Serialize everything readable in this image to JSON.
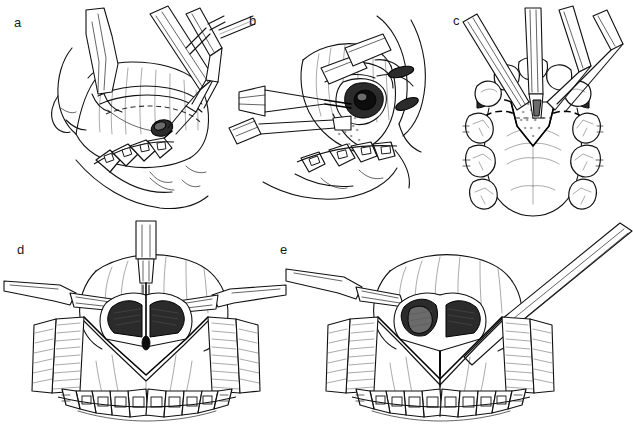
{
  "figure": {
    "kind": "surgical-technique-line-illustration",
    "background_color": "#ffffff",
    "ink_color": "#111111",
    "width": 633,
    "height": 427,
    "panel_count": 5,
    "panels": [
      {
        "label": "a",
        "label_x": 14,
        "label_y": 22,
        "view": "lateral intraoral view",
        "description": "Retractor elevating upper lip with cutting instrument and suction making mucosal incision above dentition",
        "elements": [
          "upper-lip-retractor",
          "surgical-handpiece",
          "suction-tip",
          "forceps",
          "mucosal-incision",
          "maxillary-teeth-with-archwire",
          "lower-lip-outline"
        ]
      },
      {
        "label": "b",
        "label_x": 249,
        "label_y": 20,
        "view": "lateral intraoral view",
        "description": "Subperiosteal dissection with osteotome and retractor exposing anterior maxillary bone and nasal aperture",
        "elements": [
          "osteotome",
          "chisel",
          "retractor-blade",
          "exposed-bone",
          "nasal-aperture-shadow",
          "maxillary-teeth-with-brackets"
        ]
      },
      {
        "label": "c",
        "label_x": 453,
        "label_y": 20,
        "view": "occlusal / palatal view",
        "description": "Palate seen from below with dashed osteotomy cut lines across the anterior palate and instruments entering the anterior segment",
        "elements": [
          "palatal-vault",
          "dashed-osteotomy-line",
          "anterior-palatal-segment",
          "instrument-tips",
          "maxillary-arch-teeth",
          "palatal-rugae"
        ]
      },
      {
        "label": "d",
        "label_x": 17,
        "label_y": 246,
        "view": "anterior frontal view",
        "description": "Degloved anterior maxilla with bilateral mucoperiosteal flaps retracted, bur cutting the midline, nasal septum and piriform rims exposed",
        "elements": [
          "handpiece-bur",
          "left-retractor",
          "right-retractor",
          "mucoperiosteal-flap-left",
          "mucoperiosteal-flap-right",
          "nasal-aperture",
          "nasal-septum",
          "midline-osteotomy",
          "maxillary-teeth-with-brackets",
          "archwire"
        ]
      },
      {
        "label": "e",
        "label_x": 276,
        "label_y": 246,
        "view": "anterior frontal view",
        "description": "Completed midline split held with an elevator; inferior turbinate and nasal floor visible, dashed interdental line between central incisors",
        "elements": [
          "elevator-instrument",
          "left-retractor",
          "mucoperiosteal-flap-left",
          "mucoperiosteal-flap-right",
          "nasal-aperture",
          "inferior-turbinate",
          "midline-split",
          "interdental-dashed-line",
          "maxillary-teeth-with-brackets",
          "archwire"
        ]
      }
    ]
  }
}
